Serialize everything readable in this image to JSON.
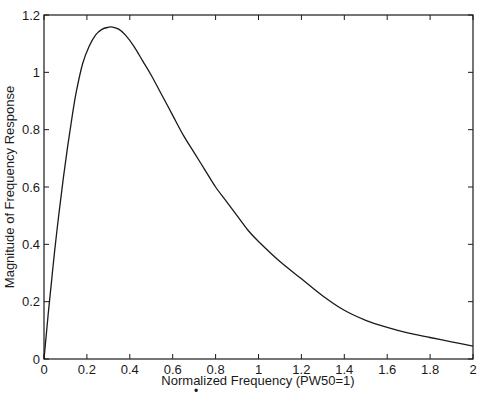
{
  "chart_data": {
    "type": "line",
    "title": "",
    "xlabel": "Normalized Frequency (PW50=1)",
    "ylabel": "Magnitude of Frequency Response",
    "xlim": [
      0,
      2
    ],
    "ylim": [
      0,
      1.2
    ],
    "xticks": [
      0,
      0.2,
      0.4,
      0.6,
      0.8,
      1,
      1.2,
      1.4,
      1.6,
      1.8,
      2
    ],
    "xtick_labels": [
      "0",
      "0.2",
      "0.4",
      "0.6",
      "0.8",
      "1",
      "1.2",
      "1.4",
      "1.6",
      "1.8",
      "2"
    ],
    "yticks": [
      0,
      0.2,
      0.4,
      0.6,
      0.8,
      1,
      1.2
    ],
    "ytick_labels": [
      "0",
      "0.2",
      "0.4",
      "0.6",
      "0.8",
      "1",
      "1.2"
    ],
    "grid": false,
    "legend": null,
    "series": [
      {
        "name": "Magnitude",
        "color": "#1a1a1a",
        "x": [
          0,
          0.01,
          0.02,
          0.035,
          0.05,
          0.07,
          0.09,
          0.11,
          0.13,
          0.15,
          0.18,
          0.21,
          0.24,
          0.27,
          0.3,
          0.32,
          0.35,
          0.38,
          0.42,
          0.46,
          0.5,
          0.55,
          0.6,
          0.65,
          0.7,
          0.75,
          0.8,
          0.85,
          0.9,
          0.95,
          1.0,
          1.1,
          1.2,
          1.3,
          1.4,
          1.5,
          1.6,
          1.7,
          1.8,
          1.9,
          2.0
        ],
        "values": [
          0,
          0.08,
          0.16,
          0.27,
          0.38,
          0.51,
          0.63,
          0.74,
          0.84,
          0.93,
          1.03,
          1.09,
          1.13,
          1.15,
          1.157,
          1.158,
          1.15,
          1.13,
          1.09,
          1.04,
          0.99,
          0.92,
          0.85,
          0.78,
          0.72,
          0.66,
          0.6,
          0.55,
          0.5,
          0.45,
          0.41,
          0.34,
          0.28,
          0.22,
          0.17,
          0.135,
          0.11,
          0.09,
          0.075,
          0.06,
          0.045
        ]
      }
    ]
  },
  "annotations": {
    "stray_mark": "•"
  }
}
